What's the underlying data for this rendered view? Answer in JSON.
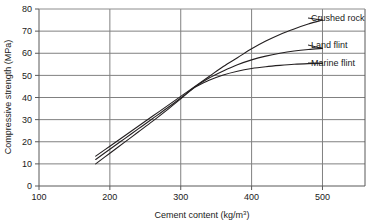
{
  "chart_data": {
    "type": "line",
    "title": "",
    "xlabel": "Cement content (kg/m",
    "xlabel_sup": "3",
    "xlabel_tail": ")",
    "xlabel_full": "Cement content (kg/m3)",
    "ylabel": "Compressive strength (MPa)",
    "xlim": [
      100,
      560
    ],
    "ylim": [
      0,
      80
    ],
    "xticks": [
      "100",
      "200",
      "300",
      "400",
      "500"
    ],
    "xtick_values": [
      100,
      200,
      300,
      400,
      500
    ],
    "yticks": [
      "0",
      "10",
      "20",
      "30",
      "40",
      "50",
      "60",
      "70",
      "80"
    ],
    "ytick_values": [
      0,
      10,
      20,
      30,
      40,
      50,
      60,
      70,
      80
    ],
    "grid": "both",
    "legend_position": "right-inline-labels",
    "series": [
      {
        "name": "Crushed rock",
        "label": "Crushed rock",
        "x": [
          180,
          200,
          220,
          240,
          260,
          280,
          300,
          320,
          340,
          360,
          380,
          400,
          420,
          440,
          460,
          480,
          500
        ],
        "values": [
          13.5,
          18.0,
          22.5,
          27.0,
          31.5,
          36.0,
          40.5,
          45.0,
          49.5,
          54.0,
          58.0,
          62.0,
          65.5,
          68.5,
          71.0,
          73.2,
          75.0
        ],
        "label_xy": [
          500,
          75.0
        ]
      },
      {
        "name": "Land flint",
        "label": "Land flint",
        "x": [
          180,
          200,
          220,
          240,
          260,
          280,
          300,
          320,
          340,
          360,
          380,
          400,
          420,
          440,
          460,
          480,
          500
        ],
        "values": [
          12.0,
          16.6,
          21.2,
          25.8,
          30.4,
          35.0,
          39.8,
          44.8,
          48.8,
          52.0,
          54.8,
          57.0,
          58.7,
          60.0,
          61.0,
          61.7,
          62.2
        ],
        "label_xy": [
          500,
          62.2
        ]
      },
      {
        "name": "Marine flint",
        "label": "Marine flint",
        "x": [
          180,
          200,
          220,
          240,
          260,
          280,
          300,
          320,
          340,
          360,
          380,
          400,
          420,
          440,
          460,
          480,
          500
        ],
        "values": [
          10.0,
          14.8,
          19.6,
          24.4,
          29.2,
          34.2,
          39.4,
          44.6,
          47.8,
          50.2,
          51.9,
          53.1,
          53.9,
          54.5,
          55.0,
          55.3,
          55.5
        ],
        "label_xy": [
          500,
          55.5
        ]
      }
    ],
    "colors": {
      "curve": "#231f20",
      "grid": "#808080",
      "axis": "#595959",
      "text": "#1a1a1a",
      "background": "#ffffff"
    }
  }
}
